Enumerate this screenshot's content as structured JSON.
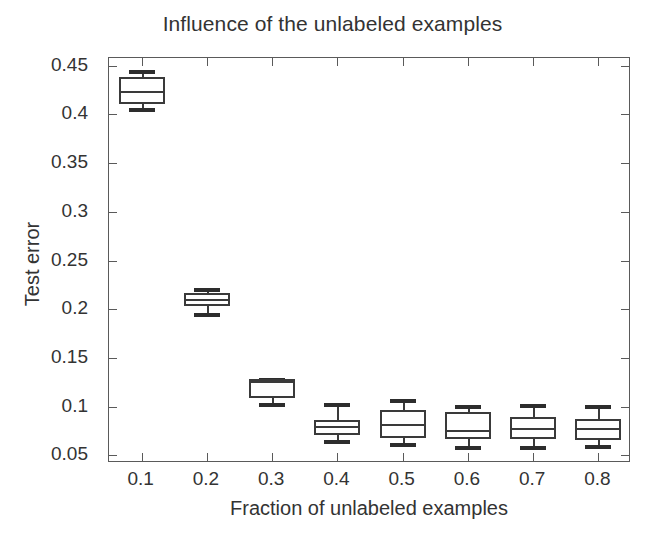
{
  "chart_data": {
    "type": "box",
    "title": "Influence of the unlabeled examples",
    "xlabel": "Fraction of unlabeled examples",
    "ylabel": "Test error",
    "categories": [
      "0.1",
      "0.2",
      "0.3",
      "0.4",
      "0.5",
      "0.6",
      "0.7",
      "0.8"
    ],
    "x_tick_labels": [
      "0.1",
      "0.2",
      "0.3",
      "0.4",
      "0.5",
      "0.6",
      "0.7",
      "0.8"
    ],
    "y_tick_labels": [
      "0.05",
      "0.1",
      "0.15",
      "0.2",
      "0.25",
      "0.3",
      "0.35",
      "0.4",
      "0.45"
    ],
    "y_tick_values": [
      0.05,
      0.1,
      0.15,
      0.2,
      0.25,
      0.3,
      0.35,
      0.4,
      0.45
    ],
    "ylim": [
      0.042,
      0.458
    ],
    "xlim": [
      0.05,
      0.85
    ],
    "grid": false,
    "legend": null,
    "line_color": "#3a3a3a",
    "box_fill": "#ffffff",
    "frame_color": "#5a5a5a",
    "boxes": [
      {
        "category": "0.1",
        "x": 0.1,
        "whisker_low": 0.4065,
        "q1": 0.4105,
        "median": 0.4245,
        "q3": 0.4385,
        "whisker_high": 0.4455
      },
      {
        "category": "0.2",
        "x": 0.2,
        "whisker_low": 0.1965,
        "q1": 0.2035,
        "median": 0.2105,
        "q3": 0.2165,
        "whisker_high": 0.2215
      },
      {
        "category": "0.3",
        "x": 0.3,
        "whisker_low": 0.1035,
        "q1": 0.1085,
        "median": 0.1265,
        "q3": 0.1285,
        "whisker_high": 0.1295
      },
      {
        "category": "0.4",
        "x": 0.4,
        "whisker_low": 0.0655,
        "q1": 0.0705,
        "median": 0.0795,
        "q3": 0.0865,
        "whisker_high": 0.1035
      },
      {
        "category": "0.5",
        "x": 0.5,
        "whisker_low": 0.0625,
        "q1": 0.0675,
        "median": 0.0825,
        "q3": 0.0965,
        "whisker_high": 0.1075
      },
      {
        "category": "0.6",
        "x": 0.6,
        "whisker_low": 0.0595,
        "q1": 0.0665,
        "median": 0.0755,
        "q3": 0.0945,
        "whisker_high": 0.1015
      },
      {
        "category": "0.7",
        "x": 0.7,
        "whisker_low": 0.0595,
        "q1": 0.0665,
        "median": 0.0775,
        "q3": 0.0895,
        "whisker_high": 0.1025
      },
      {
        "category": "0.8",
        "x": 0.8,
        "whisker_low": 0.0605,
        "q1": 0.0655,
        "median": 0.0775,
        "q3": 0.0875,
        "whisker_high": 0.1015
      }
    ]
  },
  "figure": {
    "title": "Influence of the unlabeled examples",
    "xlabel": "Fraction of unlabeled examples",
    "ylabel": "Test error"
  }
}
